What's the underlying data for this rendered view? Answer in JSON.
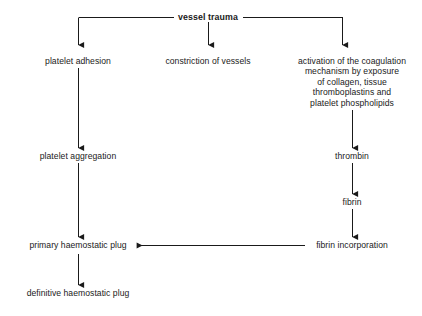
{
  "diagram": {
    "background": "#ffffff",
    "stroke_color": "#1a1a1a",
    "text_color": "#1a1a1a",
    "nodes": {
      "root": "vessel trauma",
      "platelet_adhesion": "platelet adhesion",
      "constriction": "constriction of vessels",
      "activation_line1": "activation of the coagulation",
      "activation_line2": "mechanism by exposure",
      "activation_line3": "of collagen, tissue",
      "activation_line4": "thromboplastins and",
      "activation_line5": "platelet phospholipids",
      "platelet_aggregation": "platelet aggregation",
      "thrombin": "thrombin",
      "fibrin": "fibrin",
      "primary_plug": "primary haemostatic plug",
      "fibrin_incorporation": "fibrin incorporation",
      "definitive_plug": "definitive haemostatic plug"
    }
  }
}
